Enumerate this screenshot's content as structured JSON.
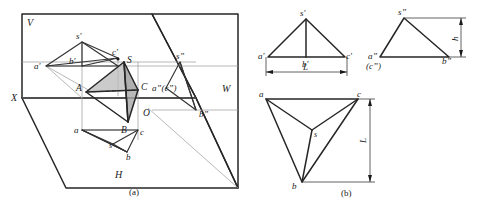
{
  "figure": {
    "title_caption_a": "(a)",
    "title_caption_b": "(b)",
    "type": "engineering-orthographic-projection-diagram"
  },
  "panel_a": {
    "plane_labels": {
      "v_plane": "V",
      "h_plane": "H",
      "w_plane": "W",
      "x_axis": "X",
      "origin": "O"
    },
    "space_points": {
      "s": "S",
      "a": "A",
      "b": "B",
      "c": "C"
    },
    "front_view_points": {
      "s_prime": "s'",
      "a_prime": "a'",
      "b_prime": "b'",
      "c_prime": "c'"
    },
    "top_view_points": {
      "s": "s",
      "a": "a",
      "b": "b",
      "c": "c"
    },
    "side_view_points": {
      "s_dprime": "s”",
      "ac_dprime": "a”(c”)",
      "b_dprime": "b”"
    }
  },
  "panel_b": {
    "front_view": {
      "s_prime": "s'",
      "a_prime": "a'",
      "b_prime": "b'",
      "c_prime": "c'",
      "dimension": "L"
    },
    "side_view": {
      "s_dprime": "s”",
      "a_dprime": "a”",
      "c_dprime": "(c”)",
      "b_dprime": "b”",
      "dimension": "h"
    },
    "top_view": {
      "s": "s",
      "a": "a",
      "b": "b",
      "c": "c",
      "dimension": "L"
    }
  },
  "colors": {
    "line": "#262626",
    "thin_line": "#8a8a8a",
    "shade": "#b9b9b9",
    "background": "#ffffff"
  }
}
